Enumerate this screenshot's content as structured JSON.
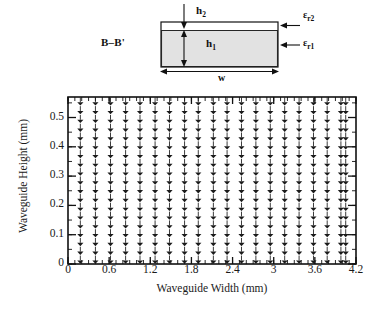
{
  "figure": {
    "cross_section": {
      "section_label": "B–B'",
      "dim_top_label": "h",
      "dim_top_sub": "2",
      "dim_side_label": "h",
      "dim_side_sub": "1",
      "dim_width_label": "w",
      "perm_upper_label": "ε",
      "perm_upper_sub": "r2",
      "perm_lower_label": "ε",
      "perm_lower_sub": "r1",
      "fill_color": "#e2e2e2",
      "outline_color": "#111111"
    }
  },
  "chart_data": {
    "type": "quiver",
    "title": "",
    "xlabel": "Waveguide Width (mm)",
    "ylabel": "Waveguide Height (mm)",
    "xlim": [
      0,
      4.2
    ],
    "ylim": [
      0,
      0.57
    ],
    "xticks": [
      0,
      0.6,
      1.2,
      1.8,
      2.4,
      3,
      3.6,
      4.2
    ],
    "xtick_labels": [
      "0",
      "0.6",
      "1.2",
      "1.8",
      "2.4",
      "3",
      "3.6",
      "4.2"
    ],
    "yticks": [
      0,
      0.1,
      0.2,
      0.3,
      0.4,
      0.5
    ],
    "ytick_labels": [
      "0",
      "0.1",
      "0.2",
      "0.3",
      "0.4",
      "0.5"
    ],
    "xminor_step": 0.1,
    "yminor_step": 0.05,
    "grid": false,
    "legend": null,
    "arrow_direction": "down",
    "arrow_color": "#1a1a1a",
    "columns_x": [
      0.18,
      0.4,
      0.62,
      0.84,
      1.05,
      1.27,
      1.48,
      1.7,
      1.9,
      2.12,
      2.32,
      2.53,
      2.74,
      2.95,
      3.16,
      3.37,
      3.58,
      3.78,
      3.98,
      4.05
    ],
    "rows_y": [
      0.555,
      0.525,
      0.495,
      0.465,
      0.435,
      0.405,
      0.375,
      0.345,
      0.315,
      0.285,
      0.255,
      0.225,
      0.195,
      0.165,
      0.135,
      0.105,
      0.075,
      0.045,
      0.015
    ],
    "vector_u": 0,
    "vector_v": -1
  }
}
